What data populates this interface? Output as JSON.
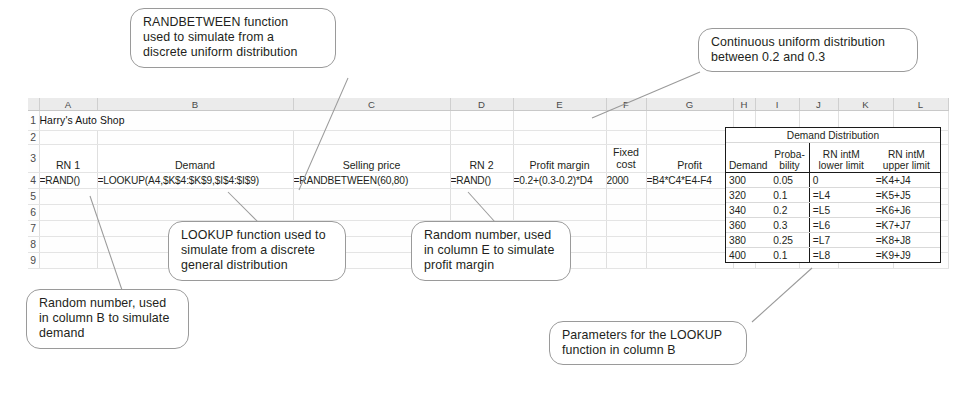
{
  "sheet": {
    "column_headers": [
      "A",
      "B",
      "C",
      "D",
      "E",
      "F",
      "G",
      "H",
      "I",
      "J",
      "K",
      "L"
    ],
    "row_numbers": [
      "1",
      "2",
      "3",
      "4",
      "5",
      "6",
      "7",
      "8",
      "9"
    ],
    "title": "Harry's Auto Shop",
    "model_headers": {
      "a": "RN 1",
      "b": "Demand",
      "c": "Selling price",
      "d": "RN 2",
      "e": "Profit margin",
      "f_line1": "Fixed",
      "f_line2": "cost",
      "g": "Profit"
    },
    "model_row4": {
      "a": "=RAND()",
      "b": "=LOOKUP(A4,$K$4:$K$9,$I$4:$I$9)",
      "c": "=RANDBETWEEN(60,80)",
      "d": "=RAND()",
      "e": "=0.2+(0.3-0.2)*D4",
      "f": "2000",
      "g": "=B4*C4*E4-F4"
    }
  },
  "distribution": {
    "title": "Demand Distribution",
    "headers": {
      "demand": "Demand",
      "prob_line1": "Proba-",
      "prob_line2": "bility",
      "lower_line1": "RN intM",
      "lower_line2": "lower limit",
      "upper_line1": "RN intM",
      "upper_line2": "upper limit"
    },
    "rows": [
      {
        "demand": "300",
        "probability": "0.05",
        "lower": "0",
        "upper": "=K4+J4"
      },
      {
        "demand": "320",
        "probability": "0.1",
        "lower": "=L4",
        "upper": "=K5+J5"
      },
      {
        "demand": "340",
        "probability": "0.2",
        "lower": "=L5",
        "upper": "=K6+J6"
      },
      {
        "demand": "360",
        "probability": "0.3",
        "lower": "=L6",
        "upper": "=K7+J7"
      },
      {
        "demand": "380",
        "probability": "0.25",
        "lower": "=L7",
        "upper": "=K8+J8"
      },
      {
        "demand": "400",
        "probability": "0.1",
        "lower": "=L8",
        "upper": "=K9+J9"
      }
    ]
  },
  "callouts": {
    "randbetween": {
      "line1": "RANDBETWEEN function",
      "line2": "used to simulate from a",
      "line3": "discrete uniform distribution"
    },
    "continuous": {
      "line1": "Continuous uniform distribution",
      "line2": "between 0.2 and 0.3"
    },
    "lookup": {
      "line1": "LOOKUP function used to",
      "line2": "simulate from a discrete",
      "line3": "general distribution"
    },
    "rn2": {
      "line1": "Random number, used",
      "line2": "in column E to simulate",
      "line3": "profit margin"
    },
    "rn1": {
      "line1": "Random number, used",
      "line2": "in column B to simulate",
      "line3": "demand"
    },
    "parameters": {
      "line1": "Parameters for the LOOKUP",
      "line2": "function in column B"
    }
  }
}
